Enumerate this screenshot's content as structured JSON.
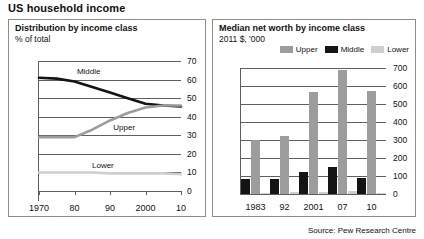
{
  "header": {
    "title": "US household income"
  },
  "source": "Source: Pew Research Centre",
  "colors": {
    "upper": "#9d9d9d",
    "middle": "#141414",
    "lower": "#cfcfcf",
    "axis": "#5f5f5f",
    "border": "#8d8d8d",
    "text": "#111111",
    "background": "#ffffff"
  },
  "left_panel": {
    "title": "Distribution by income class",
    "subtitle": "% of total"
  },
  "right_panel": {
    "title": "Median net worth by income class",
    "subtitle": "2011 $, '000",
    "legend": [
      {
        "label": "Upper",
        "color": "#9d9d9d"
      },
      {
        "label": "Middle",
        "color": "#141414"
      },
      {
        "label": "Lower",
        "color": "#cfcfcf"
      }
    ]
  },
  "chart_data": [
    {
      "id": "distribution-by-income-class",
      "type": "line",
      "title": "Distribution by income class",
      "subtitle": "% of total",
      "xlabel": "",
      "ylabel": "% of total",
      "ylim": [
        0,
        70
      ],
      "yticks": [
        0,
        10,
        20,
        30,
        40,
        50,
        60,
        70
      ],
      "ytick_labels": [
        "0",
        "10",
        "20",
        "30",
        "40",
        "50",
        "60",
        "70"
      ],
      "xlim": [
        1970,
        2010
      ],
      "xticks": [
        1970,
        1980,
        1990,
        2000,
        2010
      ],
      "xtick_labels": [
        "1970",
        "80",
        "90",
        "2000",
        "10"
      ],
      "grid": true,
      "legend_position": "inline-annotations",
      "series": [
        {
          "name": "Middle",
          "color": "#141414",
          "x": [
            1970,
            1975,
            1980,
            1985,
            1990,
            1995,
            2000,
            2005,
            2010
          ],
          "values": [
            61,
            60.5,
            59,
            56,
            53,
            50,
            47,
            46,
            45.5
          ],
          "label_x": 1984,
          "label_y": 64
        },
        {
          "name": "Upper",
          "color": "#9d9d9d",
          "x": [
            1970,
            1975,
            1980,
            1985,
            1990,
            1995,
            2000,
            2005,
            2010
          ],
          "values": [
            29,
            29,
            29,
            33,
            38,
            42,
            45,
            46,
            46
          ],
          "label_x": 1994,
          "label_y": 34
        },
        {
          "name": "Lower",
          "color": "#cfcfcf",
          "x": [
            1970,
            1975,
            1980,
            1985,
            1990,
            1995,
            2000,
            2005,
            2010
          ],
          "values": [
            10,
            10,
            10,
            10,
            9.5,
            9.5,
            9.5,
            9.5,
            9
          ],
          "label_x": 1988,
          "label_y": 13.5
        }
      ]
    },
    {
      "id": "median-net-worth-by-income-class",
      "type": "bar",
      "title": "Median net worth by income class",
      "subtitle": "2011 $, '000",
      "xlabel": "",
      "ylabel": "2011 $, '000",
      "ylim": [
        0,
        700
      ],
      "yticks": [
        0,
        100,
        200,
        300,
        400,
        500,
        600,
        700
      ],
      "ytick_labels": [
        "0",
        "100",
        "200",
        "300",
        "400",
        "500",
        "600",
        "700"
      ],
      "categories": [
        "1983",
        "92",
        "2001",
        "07",
        "10"
      ],
      "grid": true,
      "legend_position": "top-right",
      "series": [
        {
          "name": "Middle",
          "color": "#141414",
          "values": [
            85,
            85,
            125,
            150,
            90
          ]
        },
        {
          "name": "Upper",
          "color": "#9d9d9d",
          "values": [
            300,
            320,
            565,
            690,
            575
          ]
        },
        {
          "name": "Lower",
          "color": "#cfcfcf",
          "values": [
            8,
            10,
            12,
            14,
            7
          ]
        }
      ]
    }
  ]
}
